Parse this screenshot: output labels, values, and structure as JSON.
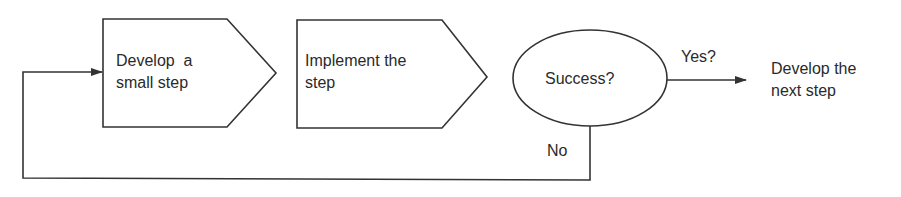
{
  "diagram": {
    "type": "flowchart",
    "nodes": [
      {
        "id": "step1",
        "shape": "pentagon-arrow",
        "label_lines": [
          "Develop  a",
          "small step"
        ]
      },
      {
        "id": "step2",
        "shape": "pentagon-arrow",
        "label_lines": [
          "Implement the",
          "step"
        ]
      },
      {
        "id": "decision",
        "shape": "ellipse",
        "label": "Success?"
      },
      {
        "id": "next",
        "shape": "text",
        "label_lines": [
          "Develop the",
          "next step"
        ]
      }
    ],
    "edges": [
      {
        "from": "decision",
        "to": "next",
        "label": "Yes?"
      },
      {
        "from": "decision",
        "to": "step1",
        "label": "No"
      }
    ],
    "colors": {
      "stroke": "#333333",
      "text": "#2a2a2a",
      "background": "#ffffff"
    }
  }
}
